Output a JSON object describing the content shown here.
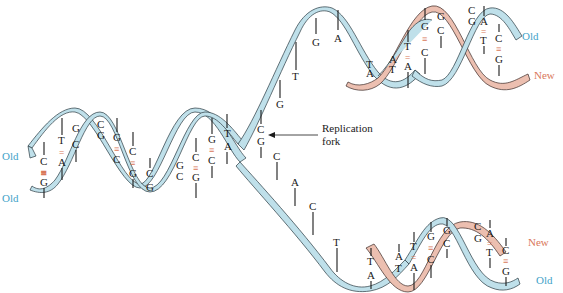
{
  "diagram": {
    "colors": {
      "old_strand": "#bfe0ea",
      "new_strand": "#ecbfb0",
      "old_label": "#3fa3c9",
      "new_label": "#d9785a",
      "bond": "#d9785a"
    },
    "labels": {
      "left_old_top": "Old",
      "left_old_bottom": "Old",
      "top_right_old": "Old",
      "top_right_new": "New",
      "bottom_right_new": "New",
      "bottom_right_old": "Old",
      "fork_line1": "Replication",
      "fork_line2": "fork"
    },
    "parent_pairs": [
      {
        "top": "C",
        "bottom": "G",
        "bond": "≡"
      },
      {
        "top": "T",
        "bottom": "A",
        "bond": "="
      },
      {
        "top": "G",
        "bottom": "C",
        "bond": ""
      },
      {
        "top": "C",
        "bottom": "G",
        "bond": ""
      },
      {
        "top": "G",
        "bottom": "C",
        "bond": "≡"
      },
      {
        "top": "C",
        "bottom": "G",
        "bond": "≡"
      },
      {
        "top": "C",
        "bottom": "G",
        "bond": ""
      },
      {
        "top": "G",
        "bottom": "C",
        "bond": ""
      },
      {
        "top": "C",
        "bottom": "G",
        "bond": "≡"
      },
      {
        "top": "G",
        "bottom": "C",
        "bond": "≡"
      },
      {
        "top": "T",
        "bottom": "A",
        "bond": ""
      },
      {
        "top": "C",
        "bottom": "G",
        "bond": ""
      }
    ],
    "upper_unpaired": [
      "G",
      "T",
      "G",
      "A"
    ],
    "lower_unpaired": [
      "C",
      "A",
      "C",
      "T"
    ],
    "upper_daughter": [
      {
        "top": "T",
        "bottom": "A"
      },
      {
        "top": "A",
        "bottom": "T"
      },
      {
        "top": "T",
        "bottom": "A"
      },
      {
        "top": "G",
        "bottom": "C"
      },
      {
        "top": "G",
        "bottom": "C"
      },
      {
        "top": "C",
        "bottom": "G"
      },
      {
        "top": "A",
        "bottom": "T"
      },
      {
        "top": "C",
        "bottom": "G"
      }
    ],
    "lower_daughter": [
      {
        "top": "T",
        "bottom": "A"
      },
      {
        "top": "A",
        "bottom": "T"
      },
      {
        "top": "T",
        "bottom": "A"
      },
      {
        "top": "G",
        "bottom": "C"
      },
      {
        "top": "G",
        "bottom": "C"
      },
      {
        "top": "C",
        "bottom": "G"
      },
      {
        "top": "A",
        "bottom": "T"
      },
      {
        "top": "C",
        "bottom": "G"
      }
    ]
  }
}
